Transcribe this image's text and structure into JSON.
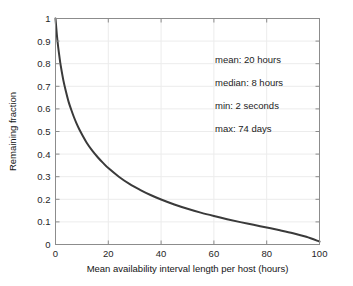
{
  "chart_data": {
    "type": "line",
    "title": "",
    "xlabel": "Mean availability interval length per host (hours)",
    "ylabel": "Remaining fraction",
    "xlim": [
      0,
      100
    ],
    "ylim": [
      0,
      1
    ],
    "grid": true,
    "legend": "none",
    "xticks": [
      "0",
      "20",
      "40",
      "60",
      "80",
      "100"
    ],
    "xtick_values": [
      0,
      20,
      40,
      60,
      80,
      100
    ],
    "yticks": [
      "0",
      "0.1",
      "0.2",
      "0.3",
      "0.4",
      "0.5",
      "0.6",
      "0.7",
      "0.8",
      "0.9",
      "1"
    ],
    "ytick_values": [
      0,
      0.1,
      0.2,
      0.3,
      0.4,
      0.5,
      0.6,
      0.7,
      0.8,
      0.9,
      1
    ],
    "series": [
      {
        "name": "Remaining fraction",
        "color": "#3a3a3a",
        "x": [
          0,
          0.5,
          1,
          1.5,
          2,
          3,
          4,
          5,
          6,
          7,
          8,
          9,
          10,
          12,
          14,
          16,
          18,
          20,
          24,
          28,
          32,
          36,
          40,
          45,
          50,
          55,
          60,
          65,
          70,
          75,
          80,
          85,
          90,
          95,
          100
        ],
        "y": [
          1.0,
          0.93,
          0.875,
          0.83,
          0.79,
          0.725,
          0.675,
          0.63,
          0.595,
          0.563,
          0.535,
          0.51,
          0.488,
          0.447,
          0.414,
          0.386,
          0.361,
          0.338,
          0.3,
          0.268,
          0.242,
          0.219,
          0.199,
          0.177,
          0.158,
          0.141,
          0.126,
          0.112,
          0.099,
          0.087,
          0.075,
          0.063,
          0.05,
          0.034,
          0.013
        ]
      }
    ],
    "annotations": [
      {
        "label": "mean: 20 hours"
      },
      {
        "label": "median: 8 hours"
      },
      {
        "label": "min: 2 seconds"
      },
      {
        "label": "max: 74 days"
      }
    ]
  }
}
